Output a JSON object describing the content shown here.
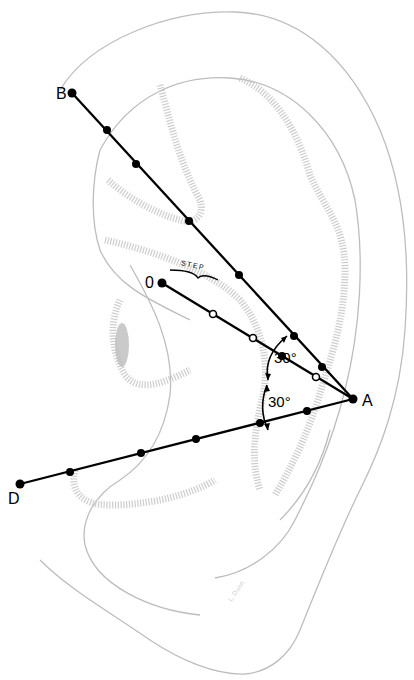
{
  "figure": {
    "points": {
      "A": {
        "label": "A",
        "x": 353,
        "y": 399
      },
      "B": {
        "label": "B",
        "x": 72,
        "y": 93
      },
      "O": {
        "label": "0",
        "x": 162,
        "y": 283
      },
      "D": {
        "label": "D",
        "x": 20,
        "y": 484
      }
    },
    "angles": [
      {
        "label": "30°",
        "between": [
          "AB",
          "AO"
        ]
      },
      {
        "label": "30°",
        "between": [
          "AO",
          "AD"
        ]
      }
    ],
    "step_label": "STEP",
    "signature": "L. Dunn",
    "lines": {
      "BA_dots": [
        [
          107,
          130
        ],
        [
          136,
          164
        ],
        [
          189,
          221
        ],
        [
          239,
          275
        ],
        [
          294,
          336
        ],
        [
          322,
          367
        ]
      ],
      "OA_open_dots": [
        [
          213,
          355
        ],
        [
          253,
          368
        ],
        [
          316,
          387
        ]
      ],
      "OA_filled_dots": [
        [
          282,
          377
        ]
      ],
      "DA_dots": [
        [
          70,
          473
        ],
        [
          141,
          454
        ],
        [
          196,
          439
        ],
        [
          260,
          423
        ],
        [
          307,
          411
        ]
      ]
    },
    "colors": {
      "line": "#000000",
      "ear_outline": "#bdbdbd",
      "hatching": "#c8c8c8"
    }
  }
}
